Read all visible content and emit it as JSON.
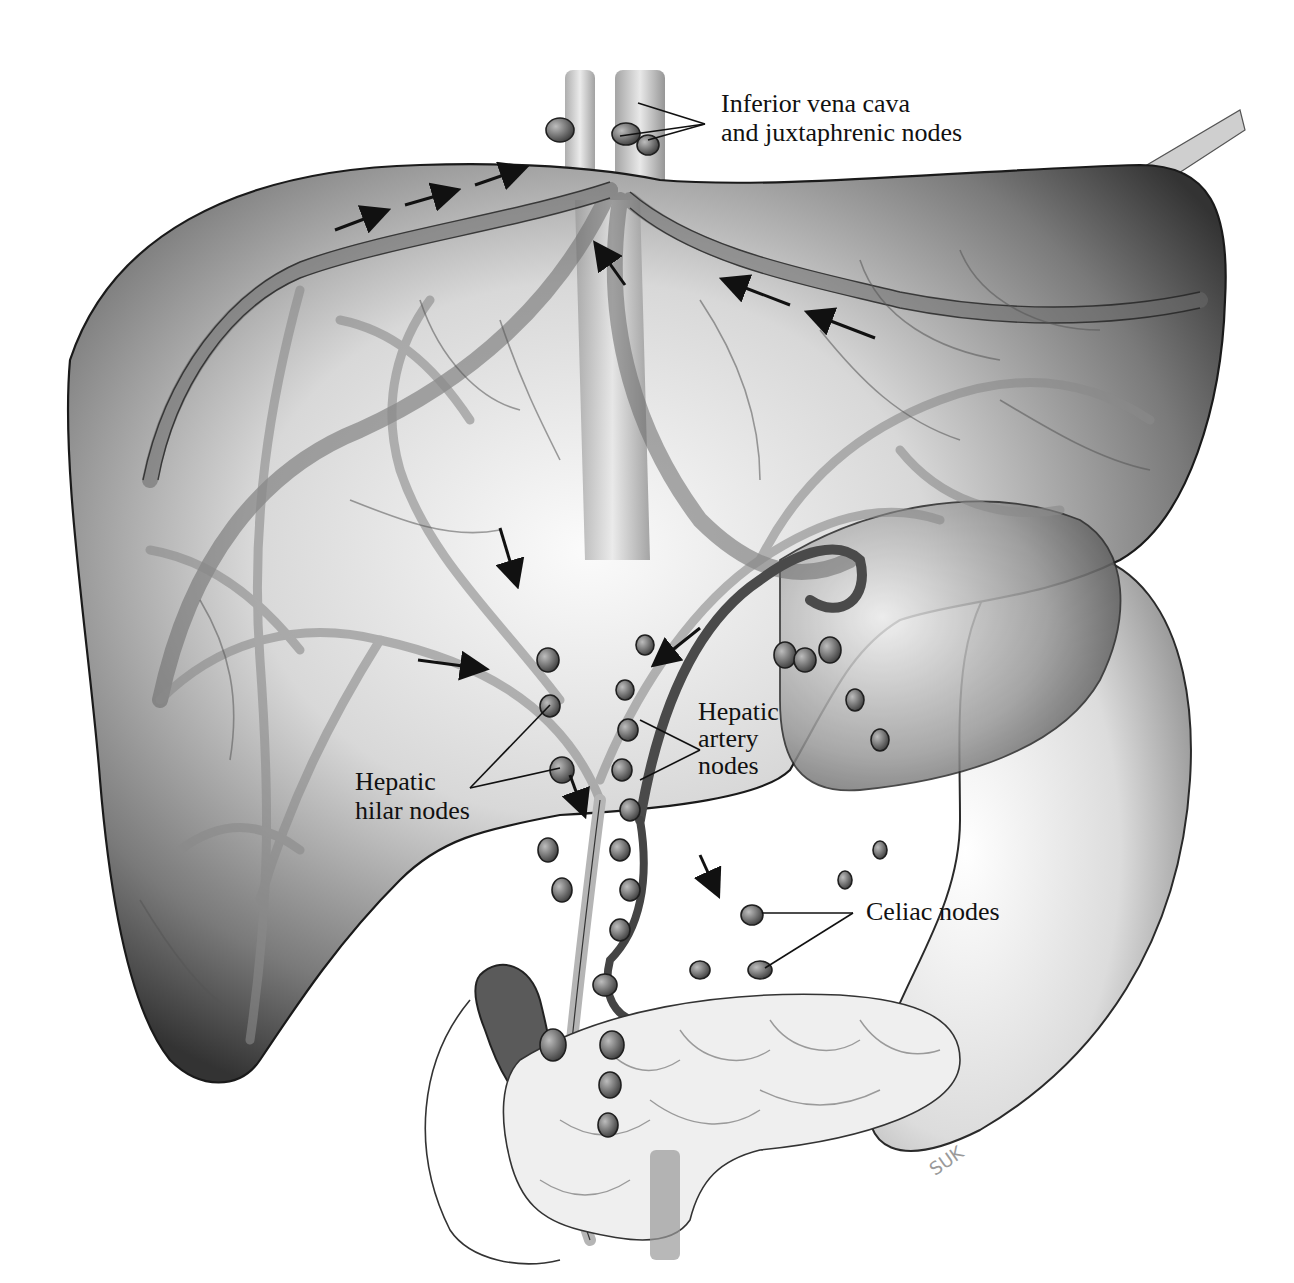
{
  "figure": {
    "style": "grayscale anatomical illustration",
    "colors": {
      "background": "#ffffff",
      "liver_dark": "#3a3a3a",
      "liver_mid": "#8c8c8c",
      "liver_light": "#f2f2f2",
      "outline": "#1a1a1a",
      "node_fill": "#5a5a5a",
      "label_text": "#111111"
    }
  },
  "labels": [
    {
      "id": "ivc",
      "lines": [
        "Inferior vena cava",
        "and juxtaphrenic nodes"
      ]
    },
    {
      "id": "hepatic_artery",
      "lines": [
        "Hepatic",
        "artery",
        "nodes"
      ]
    },
    {
      "id": "hepatic_hilar",
      "lines": [
        "Hepatic",
        "hilar nodes"
      ]
    },
    {
      "id": "celiac",
      "lines": [
        "Celiac nodes"
      ]
    }
  ],
  "signature": "SUK",
  "structures": [
    "liver",
    "inferior vena cava",
    "hepatic veins",
    "portal vein branches",
    "hepatic artery",
    "common bile duct",
    "stomach",
    "pancreas",
    "duodenum",
    "gallbladder",
    "lymph nodes",
    "flow arrows"
  ]
}
